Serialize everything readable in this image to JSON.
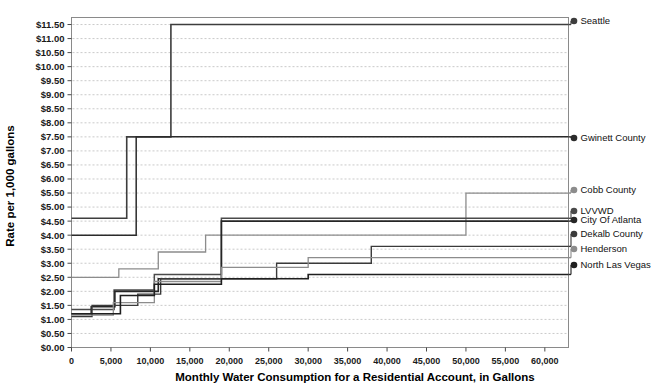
{
  "chart_data": {
    "type": "line",
    "title": "",
    "xlabel": "Monthly Water Consumption for a Residential Account, in Gallons",
    "ylabel": "Rate per 1,000 gallons",
    "xlim": [
      0,
      63000
    ],
    "ylim": [
      0,
      11.75
    ],
    "grid": true,
    "legend_position": "right",
    "x_ticks": [
      0,
      5000,
      10000,
      15000,
      20000,
      25000,
      30000,
      35000,
      40000,
      45000,
      50000,
      55000,
      60000
    ],
    "x_tick_labels": [
      "0",
      "5,000",
      "10,000",
      "15,000",
      "20,000",
      "25,000",
      "30,000",
      "35,000",
      "40,000",
      "45,000",
      "50,000",
      "55,000",
      "60,000"
    ],
    "y_ticks": [
      0,
      0.5,
      1.0,
      1.5,
      2.0,
      2.5,
      3.0,
      3.5,
      4.0,
      4.5,
      5.0,
      5.5,
      6.0,
      6.5,
      7.0,
      7.5,
      8.0,
      8.5,
      9.0,
      9.5,
      10.0,
      10.5,
      11.0,
      11.5
    ],
    "y_tick_labels": [
      "$0.00",
      "$0.50",
      "$1.00",
      "$1.50",
      "$2.00",
      "$2.50",
      "$3.00",
      "$3.50",
      "$4.00",
      "$4.50",
      "$5.00",
      "$5.50",
      "$6.00",
      "$6.50",
      "$7.00",
      "$7.50",
      "$8.00",
      "$8.50",
      "$9.00",
      "$9.50",
      "$10.00",
      "$10.50",
      "$11.00",
      "$11.50"
    ],
    "series": [
      {
        "name": "Seattle",
        "color": "#3d3d3d",
        "width": 1.6,
        "marker": "circle",
        "end_value": 11.5,
        "steps": [
          [
            0,
            4.6
          ],
          [
            7000,
            4.6
          ],
          [
            7000,
            7.5
          ],
          [
            12600,
            7.5
          ],
          [
            12600,
            11.5
          ],
          [
            63000,
            11.5
          ]
        ]
      },
      {
        "name": "Gwinett County",
        "color": "#2b2b2b",
        "width": 1.5,
        "marker": "circle",
        "end_value": 7.5,
        "steps": [
          [
            0,
            4.0
          ],
          [
            2600,
            4.0
          ],
          [
            2600,
            4.0
          ],
          [
            8200,
            4.0
          ],
          [
            8200,
            7.5
          ],
          [
            63000,
            7.5
          ]
        ]
      },
      {
        "name": "Cobb County",
        "color": "#8c8c8c",
        "width": 1.3,
        "marker": "circle",
        "end_value": 5.5,
        "steps": [
          [
            0,
            2.5
          ],
          [
            6000,
            2.5
          ],
          [
            6000,
            2.8
          ],
          [
            11000,
            2.8
          ],
          [
            11000,
            3.4
          ],
          [
            17000,
            3.4
          ],
          [
            17000,
            4.0
          ],
          [
            50000,
            4.0
          ],
          [
            50000,
            5.5
          ],
          [
            63000,
            5.5
          ]
        ]
      },
      {
        "name": "LVVWD",
        "color": "#4a4a4a",
        "width": 1.5,
        "marker": "circle",
        "end_value": 4.6,
        "steps": [
          [
            0,
            1.35
          ],
          [
            2500,
            1.35
          ],
          [
            2500,
            1.35
          ],
          [
            5400,
            1.35
          ],
          [
            5400,
            2.05
          ],
          [
            10500,
            2.05
          ],
          [
            10500,
            2.6
          ],
          [
            19000,
            2.6
          ],
          [
            19000,
            4.6
          ],
          [
            63000,
            4.6
          ]
        ]
      },
      {
        "name": "City Of Atlanta",
        "color": "#262626",
        "width": 1.6,
        "marker": "circle",
        "end_value": 4.5,
        "steps": [
          [
            0,
            1.2
          ],
          [
            2500,
            1.2
          ],
          [
            2500,
            1.45
          ],
          [
            5500,
            1.45
          ],
          [
            5500,
            2.0
          ],
          [
            11000,
            2.0
          ],
          [
            11000,
            2.45
          ],
          [
            19000,
            2.45
          ],
          [
            19000,
            4.5
          ],
          [
            63000,
            4.5
          ]
        ]
      },
      {
        "name": "Dekalb County",
        "color": "#3a3a3a",
        "width": 1.4,
        "marker": "circle",
        "end_value": 3.6,
        "steps": [
          [
            0,
            1.1
          ],
          [
            2600,
            1.1
          ],
          [
            2600,
            1.5
          ],
          [
            8400,
            1.5
          ],
          [
            8400,
            1.9
          ],
          [
            11300,
            1.9
          ],
          [
            11300,
            2.45
          ],
          [
            19500,
            2.45
          ],
          [
            19500,
            2.45
          ],
          [
            26000,
            2.45
          ],
          [
            26000,
            3.0
          ],
          [
            38000,
            3.0
          ],
          [
            38000,
            3.6
          ],
          [
            63000,
            3.6
          ]
        ]
      },
      {
        "name": "Henderson",
        "color": "#8c8c8c",
        "width": 1.3,
        "marker": "circle",
        "end_value": 3.2,
        "steps": [
          [
            0,
            1.15
          ],
          [
            5300,
            1.15
          ],
          [
            5300,
            1.6
          ],
          [
            10500,
            1.6
          ],
          [
            10500,
            2.35
          ],
          [
            19000,
            2.35
          ],
          [
            19000,
            2.85
          ],
          [
            30000,
            2.85
          ],
          [
            30000,
            3.2
          ],
          [
            63000,
            3.2
          ]
        ]
      },
      {
        "name": "North Las Vegas",
        "color": "#1f1f1f",
        "width": 1.6,
        "marker": "circle",
        "end_value": 2.6,
        "steps": [
          [
            0,
            1.2
          ],
          [
            2500,
            1.2
          ],
          [
            2500,
            1.2
          ],
          [
            6200,
            1.2
          ],
          [
            6200,
            1.85
          ],
          [
            10500,
            1.85
          ],
          [
            10500,
            2.25
          ],
          [
            19000,
            2.25
          ],
          [
            19000,
            2.45
          ],
          [
            30000,
            2.45
          ],
          [
            30000,
            2.6
          ],
          [
            63000,
            2.6
          ]
        ]
      }
    ],
    "legend_entries": [
      {
        "label": "Seattle",
        "value": 11.5,
        "color": "#3d3d3d"
      },
      {
        "label": "Gwinett County",
        "value": 7.5,
        "color": "#2b2b2b"
      },
      {
        "label": "Cobb County",
        "value": 5.5,
        "color": "#8c8c8c"
      },
      {
        "label": "LVVWD",
        "value": 4.6,
        "color": "#4a4a4a"
      },
      {
        "label": "City Of Atlanta",
        "value": 4.5,
        "color": "#262626"
      },
      {
        "label": "Dekalb County",
        "value": 3.6,
        "color": "#3a3a3a"
      },
      {
        "label": "Henderson",
        "value": 3.2,
        "color": "#8c8c8c"
      },
      {
        "label": "North Las Vegas",
        "value": 2.6,
        "color": "#1f1f1f"
      }
    ]
  }
}
